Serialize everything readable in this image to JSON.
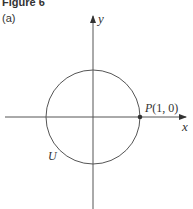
{
  "figure": {
    "title": "Figure 6",
    "subfigure": "(a)"
  },
  "diagram": {
    "axes": {
      "x_label": "x",
      "y_label": "y"
    },
    "circle": {
      "label": "U",
      "center": [
        0,
        0
      ],
      "radius": 1
    },
    "point": {
      "label": "P(1, 0)"
    },
    "colors": {
      "line": "#555555",
      "text": "#333333"
    }
  }
}
